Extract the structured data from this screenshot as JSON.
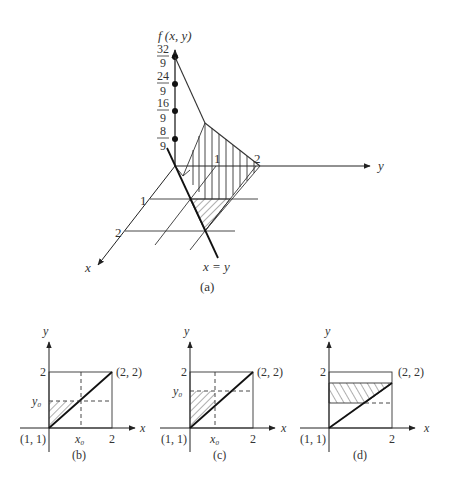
{
  "figure_a": {
    "caption": "(a)",
    "z_axis_label": "f (x, y)",
    "y_axis_label": "y",
    "x_axis_label": "x",
    "z_ticks": [
      {
        "num": "32",
        "den": "9"
      },
      {
        "num": "24",
        "den": "9"
      },
      {
        "num": "16",
        "den": "9"
      },
      {
        "num": "8",
        "den": "9"
      }
    ],
    "x_ticks": [
      "1",
      "2"
    ],
    "y_ticks": [
      "1",
      "2"
    ],
    "line_label": "x = y"
  },
  "figure_b": {
    "caption": "(b)",
    "x_label": "x",
    "y_label": "y",
    "origin_label": "(1, 1)",
    "corner_label": "(2, 2)",
    "x_tick": "2",
    "y_tick": "2",
    "x0_label": "x₀",
    "y0_label": "y₀"
  },
  "figure_c": {
    "caption": "(c)",
    "x_label": "x",
    "y_label": "y",
    "origin_label": "(1, 1)",
    "corner_label": "(2, 2)",
    "x_tick": "2",
    "y_tick": "2",
    "x0_label": "x₀",
    "y0_label": "y₀"
  },
  "figure_d": {
    "caption": "(d)",
    "x_label": "x",
    "y_label": "y",
    "origin_label": "(1, 1)",
    "corner_label": "(2, 2)",
    "x_tick": "2",
    "y_tick": "2"
  }
}
